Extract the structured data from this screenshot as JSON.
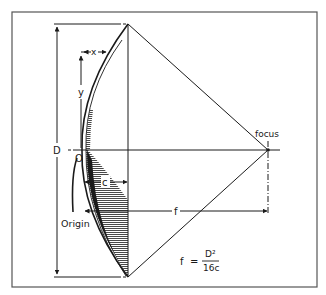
{
  "diagram": {
    "labels": {
      "x": "x",
      "y": "y",
      "D": "D",
      "O": "O",
      "c": "c",
      "f": "f",
      "focus": "focus",
      "origin": "Origin"
    },
    "formula": {
      "lhs": "f",
      "equals": "=",
      "numerator": "D²",
      "denominator": "16c"
    },
    "colors": {
      "line": "#1a1a1a",
      "frame": "#555555",
      "background": "#ffffff"
    }
  }
}
